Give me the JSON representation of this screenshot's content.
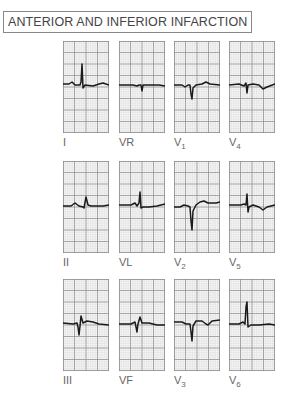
{
  "title": "ANTERIOR AND INFERIOR INFARCTION",
  "colors": {
    "grid_minor": "#d4d4d4",
    "grid_major": "#8a8a8a",
    "trace": "#1a1a1a",
    "border": "#888888"
  },
  "leads": [
    {
      "id": "I",
      "lead": "I",
      "sub": "",
      "x": 63,
      "y": 41,
      "trace": "M0,43 L6,43 L9,41 L12,44 L17,44 L18,41 L19,23 L20,47 L22,44 L30,45 L36,43 L40,42 L46,44"
    },
    {
      "id": "VR",
      "lead": "VR",
      "sub": "",
      "x": 119,
      "y": 41,
      "trace": "M0,44 L14,44 L18,45 L20,44 L22,44 L23,50 L24,44 L30,44 L40,44 L46,45"
    },
    {
      "id": "V1",
      "lead": "V",
      "sub": "1",
      "x": 174,
      "y": 41,
      "trace": "M0,44 L8,44 L11,46 L14,44 L16,44 L17,53 L18,58 L19,47 L22,44 L28,43 L32,41 L36,43 L46,44"
    },
    {
      "id": "V4",
      "lead": "V",
      "sub": "4",
      "x": 229,
      "y": 41,
      "trace": "M0,44 L10,43 L15,45 L17,42 L18,52 L19,44 L24,43 L30,44 L34,48 L38,46 L46,43"
    },
    {
      "id": "II",
      "lead": "II",
      "sub": "",
      "x": 63,
      "y": 161,
      "trace": "M0,45 L8,45 L12,42 L16,45 L20,46 L21,47 L23,36 L25,44 L28,45 L40,45 L46,44"
    },
    {
      "id": "VL",
      "lead": "VL",
      "sub": "",
      "x": 119,
      "y": 161,
      "trace": "M0,44 L12,44 L16,42 L18,45 L20,42 L21,31 L22,47 L24,46 L30,46 L38,45 L46,43"
    },
    {
      "id": "V2",
      "lead": "V",
      "sub": "2",
      "x": 174,
      "y": 161,
      "trace": "M0,46 L6,46 L10,44 L14,45 L16,46 L17,60 L18,69 L19,50 L22,44 L26,41 L30,40 L34,42 L42,42 L46,41"
    },
    {
      "id": "V5",
      "lead": "V",
      "sub": "5",
      "x": 229,
      "y": 161,
      "trace": "M0,44 L12,44 L15,43 L17,44 L18,33 L19,51 L20,46 L24,44 L30,46 L34,49 L38,46 L46,44"
    },
    {
      "id": "III",
      "lead": "III",
      "sub": "",
      "x": 63,
      "y": 279,
      "trace": "M0,44 L10,45 L14,44 L15,48 L16,56 L17,47 L18,37 L20,44 L24,42 L30,43 L36,45 L46,46"
    },
    {
      "id": "VF",
      "lead": "VF",
      "sub": "",
      "x": 119,
      "y": 279,
      "trace": "M0,45 L12,45 L16,43 L17,48 L18,53 L19,45 L21,38 L23,44 L30,44 L38,46 L46,46"
    },
    {
      "id": "V3",
      "lead": "V",
      "sub": "3",
      "x": 174,
      "y": 279,
      "trace": "M0,43 L8,43 L12,45 L16,45 L17,53 L18,62 L19,47 L22,42 L28,42 L32,45 L34,46 L38,42 L46,41"
    },
    {
      "id": "V6",
      "lead": "V",
      "sub": "6",
      "x": 229,
      "y": 279,
      "trace": "M0,45 L10,45 L14,43 L16,45 L17,28 L18,23 L19,48 L22,46 L30,46 L40,45 L46,46"
    }
  ],
  "labels": [
    {
      "lead": "I",
      "sub": "",
      "x": 63,
      "y": 136
    },
    {
      "lead": "VR",
      "sub": "",
      "x": 119,
      "y": 136
    },
    {
      "lead": "V",
      "sub": "1",
      "x": 174,
      "y": 136
    },
    {
      "lead": "V",
      "sub": "4",
      "x": 229,
      "y": 136
    },
    {
      "lead": "II",
      "sub": "",
      "x": 63,
      "y": 256
    },
    {
      "lead": "VL",
      "sub": "",
      "x": 119,
      "y": 256
    },
    {
      "lead": "V",
      "sub": "2",
      "x": 174,
      "y": 256
    },
    {
      "lead": "V",
      "sub": "5",
      "x": 229,
      "y": 256
    },
    {
      "lead": "III",
      "sub": "",
      "x": 63,
      "y": 374
    },
    {
      "lead": "VF",
      "sub": "",
      "x": 119,
      "y": 374
    },
    {
      "lead": "V",
      "sub": "3",
      "x": 174,
      "y": 374
    },
    {
      "lead": "V",
      "sub": "6",
      "x": 229,
      "y": 374
    }
  ]
}
